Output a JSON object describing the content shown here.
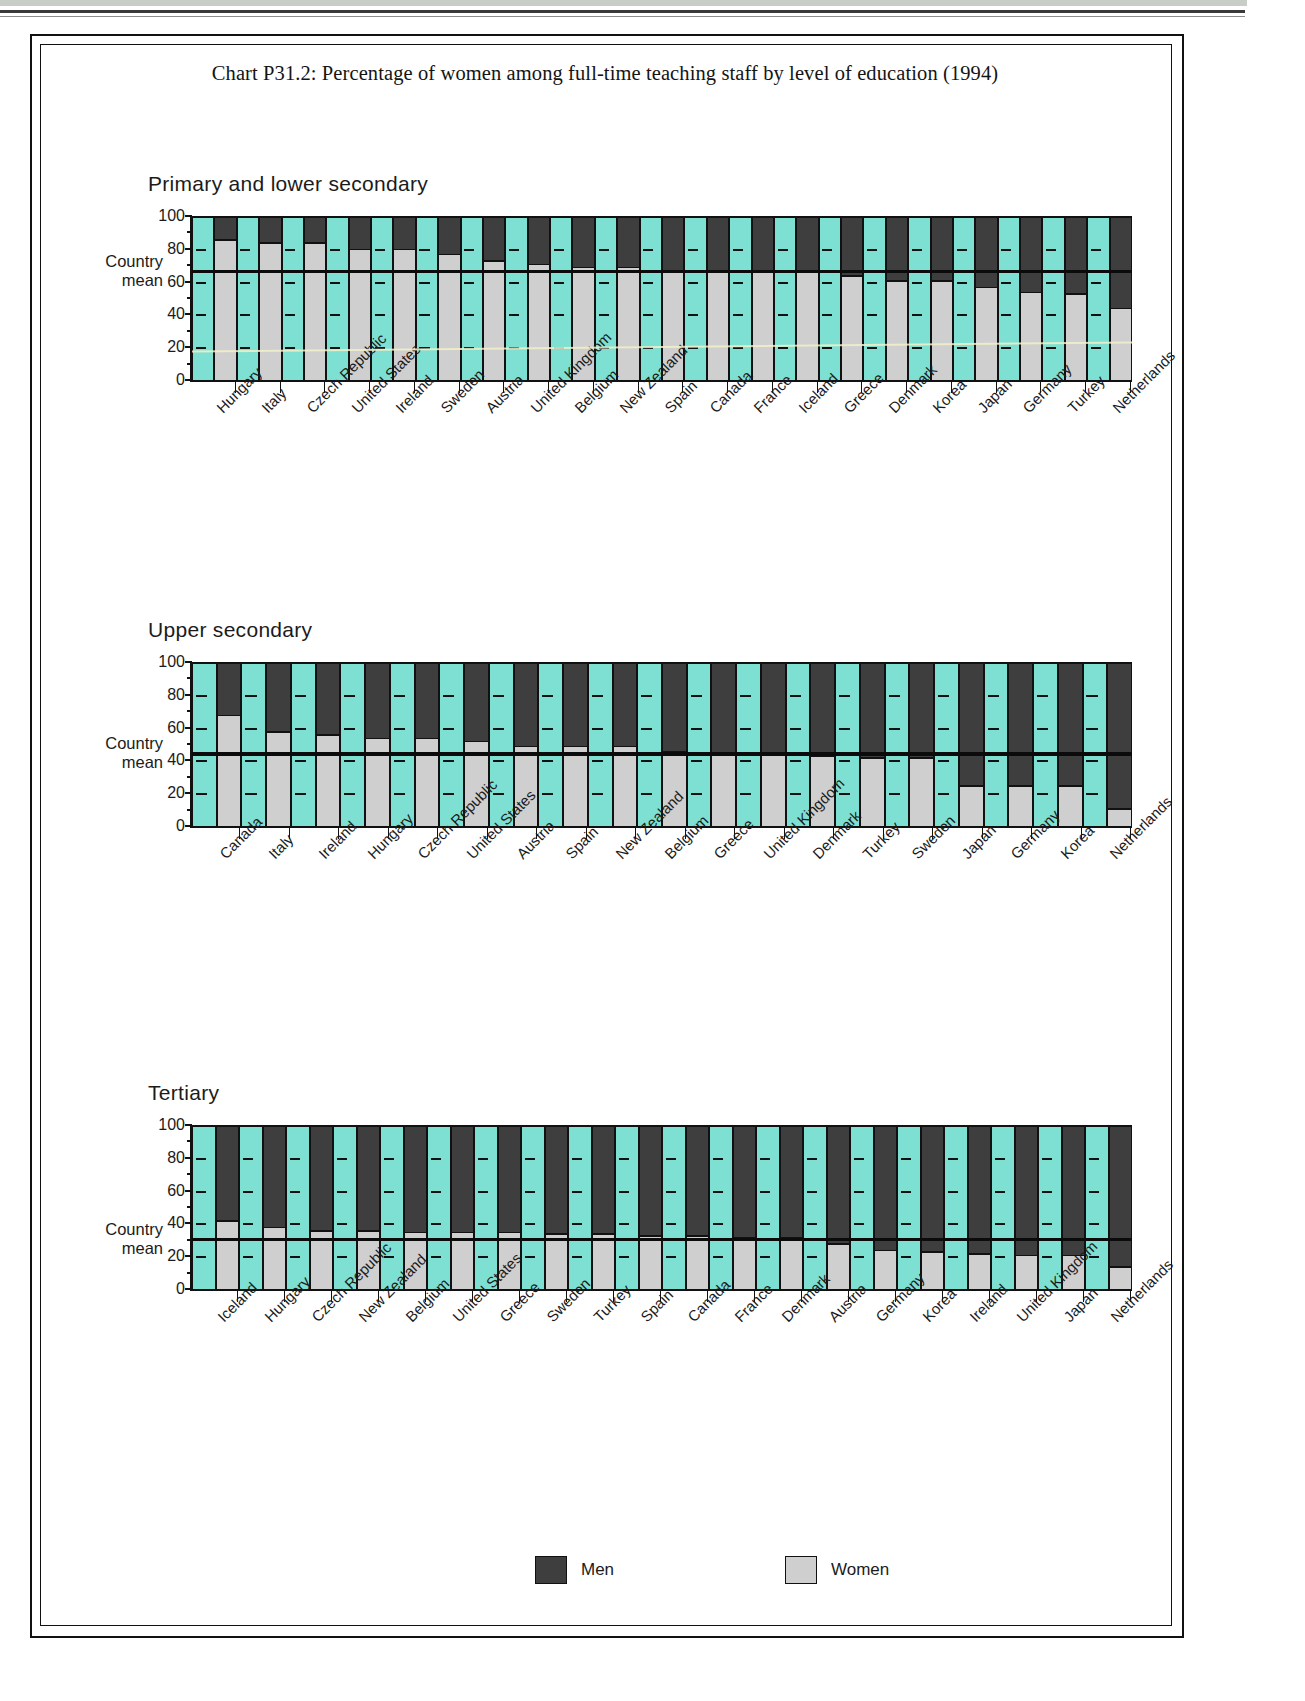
{
  "document": {
    "title": "Chart P31.2: Percentage of women among full-time teaching staff by level of education (1994)"
  },
  "axis": {
    "y_ticks": [
      "100",
      "80",
      "60",
      "40",
      "20",
      "0"
    ],
    "country_mean_line1": "Country",
    "country_mean_line2": "mean"
  },
  "legend": {
    "men_label": "Men",
    "women_label": "Women",
    "men_color": "#3e3e3e",
    "women_color": "#cfcfcf",
    "band_color": "#7ee0d2"
  },
  "panels": [
    {
      "title": "Primary and lower secondary"
    },
    {
      "title": "Upper secondary"
    },
    {
      "title": "Tertiary"
    }
  ],
  "chart_data": [
    {
      "type": "bar",
      "subtype": "stacked-100",
      "title": "Primary and lower secondary",
      "xlabel": "",
      "ylabel": "",
      "ylim": [
        0,
        100
      ],
      "ytick_values": [
        0,
        20,
        40,
        60,
        80,
        100
      ],
      "grid": false,
      "legend": [
        "Men",
        "Women"
      ],
      "legend_position": "bottom",
      "country_mean": 66,
      "categories": [
        "Hungary",
        "Italy",
        "Czech Republic",
        "United States",
        "Ireland",
        "Sweden",
        "Austria",
        "United Kingdom",
        "Belgium",
        "New Zealand",
        "Spain",
        "Canada",
        "France",
        "Iceland",
        "Greece",
        "Denmark",
        "Korea",
        "Japan",
        "Germany",
        "Turkey",
        "Netherlands"
      ],
      "series": [
        {
          "name": "Women",
          "values": [
            85,
            83,
            83,
            79,
            79,
            76,
            72,
            70,
            68,
            68,
            66,
            66,
            66,
            65,
            63,
            60,
            60,
            56,
            53,
            52,
            43,
            26
          ]
        },
        {
          "name": "Men",
          "values": [
            15,
            17,
            17,
            21,
            21,
            24,
            28,
            30,
            32,
            32,
            34,
            34,
            34,
            35,
            37,
            40,
            40,
            44,
            47,
            48,
            57,
            74
          ]
        }
      ]
    },
    {
      "type": "bar",
      "subtype": "stacked-100",
      "title": "Upper secondary",
      "xlabel": "",
      "ylabel": "",
      "ylim": [
        0,
        100
      ],
      "ytick_values": [
        0,
        20,
        40,
        60,
        80,
        100
      ],
      "grid": false,
      "legend": [
        "Men",
        "Women"
      ],
      "legend_position": "bottom",
      "country_mean": 44,
      "categories": [
        "Canada",
        "Italy",
        "Ireland",
        "Hungary",
        "Czech Republic",
        "United States",
        "Austria",
        "Spain",
        "New Zealand",
        "Belgium",
        "Greece",
        "United Kingdom",
        "Denmark",
        "Turkey",
        "Sweden",
        "Japan",
        "Germany",
        "Korea",
        "Netherlands"
      ],
      "series": [
        {
          "name": "Women",
          "values": [
            67,
            57,
            55,
            53,
            53,
            51,
            48,
            48,
            48,
            45,
            44,
            43,
            42,
            41,
            41,
            24,
            24,
            24,
            10
          ]
        },
        {
          "name": "Men",
          "values": [
            33,
            43,
            45,
            47,
            47,
            49,
            52,
            52,
            52,
            55,
            56,
            57,
            58,
            59,
            59,
            76,
            76,
            76,
            90
          ]
        }
      ]
    },
    {
      "type": "bar",
      "subtype": "stacked-100",
      "title": "Tertiary",
      "xlabel": "",
      "ylabel": "",
      "ylim": [
        0,
        100
      ],
      "ytick_values": [
        0,
        20,
        40,
        60,
        80,
        100
      ],
      "grid": false,
      "legend": [
        "Men",
        "Women"
      ],
      "legend_position": "bottom",
      "country_mean": 30,
      "categories": [
        "Iceland",
        "Hungary",
        "Czech Republic",
        "New Zealand",
        "Belgium",
        "United States",
        "Greece",
        "Sweden",
        "Turkey",
        "Spain",
        "Canada",
        "France",
        "Denmark",
        "Austria",
        "Germany",
        "Korea",
        "Ireland",
        "United Kingdom",
        "Japan",
        "Netherlands"
      ],
      "series": [
        {
          "name": "Women",
          "values": [
            41,
            37,
            35,
            35,
            34,
            34,
            34,
            33,
            33,
            32,
            32,
            31,
            31,
            27,
            23,
            22,
            21,
            20,
            20,
            13
          ]
        },
        {
          "name": "Men",
          "values": [
            59,
            63,
            65,
            65,
            66,
            66,
            66,
            67,
            67,
            68,
            68,
            69,
            69,
            73,
            77,
            78,
            79,
            80,
            80,
            87
          ]
        }
      ]
    }
  ]
}
